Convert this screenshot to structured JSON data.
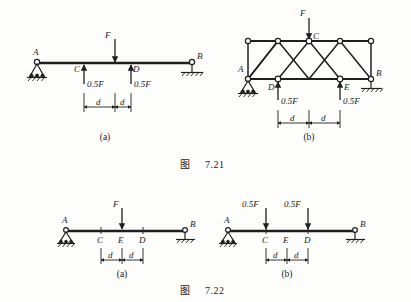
{
  "page": {
    "background": "#fdfdfb",
    "ink": "#1f1f1f"
  },
  "figures": [
    {
      "id": "fig-7-21",
      "caption_prefix": "图",
      "caption_number": "7.21",
      "panels": [
        {
          "id": "7-21-a",
          "sublabel": "(a)",
          "type": "simply-supported-beam",
          "supports": [
            {
              "node": "A",
              "kind": "pin",
              "label": "A"
            },
            {
              "node": "B",
              "kind": "roller",
              "label": "B"
            }
          ],
          "points": [
            {
              "label": "A",
              "role": "support-left"
            },
            {
              "label": "C",
              "role": "load-point"
            },
            {
              "label": "D",
              "role": "load-point"
            },
            {
              "label": "B",
              "role": "support-right"
            }
          ],
          "loads": [
            {
              "label": "F",
              "magnitude": "F",
              "direction": "down",
              "at": "midspan-CD",
              "side": "above"
            },
            {
              "label": "0.5F",
              "magnitude": "0.5F",
              "direction": "up",
              "at": "C",
              "side": "below"
            },
            {
              "label": "0.5F",
              "magnitude": "0.5F",
              "direction": "up",
              "at": "D",
              "side": "below"
            }
          ],
          "dimensions": [
            {
              "label": "d",
              "from": "C",
              "to": "midspan-CD"
            },
            {
              "label": "d",
              "from": "midspan-CD",
              "to": "D"
            }
          ]
        },
        {
          "id": "7-21-b",
          "sublabel": "(b)",
          "type": "truss",
          "supports": [
            {
              "node": "A",
              "kind": "pin",
              "label": "A"
            },
            {
              "node": "B",
              "kind": "roller",
              "label": "B"
            }
          ],
          "points": [
            {
              "label": "A",
              "role": "bottom-left-support"
            },
            {
              "label": "C",
              "role": "top-center"
            },
            {
              "label": "D",
              "role": "bottom-load"
            },
            {
              "label": "E",
              "role": "bottom-load"
            },
            {
              "label": "B",
              "role": "bottom-right-support"
            }
          ],
          "top_chord_nodes": 5,
          "bottom_chord_nodes": 4,
          "loads": [
            {
              "label": "F",
              "magnitude": "F",
              "direction": "down",
              "at": "C",
              "side": "above"
            },
            {
              "label": "0.5F",
              "magnitude": "0.5F",
              "direction": "up",
              "at": "D",
              "side": "below"
            },
            {
              "label": "0.5F",
              "magnitude": "0.5F",
              "direction": "up",
              "at": "E",
              "side": "below"
            }
          ],
          "dimensions": [
            {
              "label": "d",
              "from": "D",
              "to": "center"
            },
            {
              "label": "d",
              "from": "center",
              "to": "E"
            }
          ]
        }
      ]
    },
    {
      "id": "fig-7-22",
      "caption_prefix": "图",
      "caption_number": "7.22",
      "panels": [
        {
          "id": "7-22-a",
          "sublabel": "(a)",
          "type": "simply-supported-beam",
          "supports": [
            {
              "node": "A",
              "kind": "pin",
              "label": "A"
            },
            {
              "node": "B",
              "kind": "roller",
              "label": "B"
            }
          ],
          "points": [
            {
              "label": "A",
              "role": "support-left"
            },
            {
              "label": "C",
              "role": "marker"
            },
            {
              "label": "E",
              "role": "load-point"
            },
            {
              "label": "D",
              "role": "marker"
            },
            {
              "label": "B",
              "role": "support-right"
            }
          ],
          "loads": [
            {
              "label": "F",
              "magnitude": "F",
              "direction": "down",
              "at": "E",
              "side": "above"
            }
          ],
          "dimensions": [
            {
              "label": "d",
              "from": "C",
              "to": "E"
            },
            {
              "label": "d",
              "from": "E",
              "to": "D"
            }
          ]
        },
        {
          "id": "7-22-b",
          "sublabel": "(b)",
          "type": "simply-supported-beam",
          "supports": [
            {
              "node": "A",
              "kind": "pin",
              "label": "A"
            },
            {
              "node": "B",
              "kind": "roller",
              "label": "B"
            }
          ],
          "points": [
            {
              "label": "A",
              "role": "support-left"
            },
            {
              "label": "C",
              "role": "load-point"
            },
            {
              "label": "E",
              "role": "marker"
            },
            {
              "label": "D",
              "role": "load-point"
            },
            {
              "label": "B",
              "role": "support-right"
            }
          ],
          "loads": [
            {
              "label": "0.5F",
              "magnitude": "0.5F",
              "direction": "down",
              "at": "C",
              "side": "above"
            },
            {
              "label": "0.5F",
              "magnitude": "0.5F",
              "direction": "down",
              "at": "D",
              "side": "above"
            }
          ],
          "dimensions": [
            {
              "label": "d",
              "from": "C",
              "to": "E"
            },
            {
              "label": "d",
              "from": "E",
              "to": "D"
            }
          ]
        }
      ]
    }
  ],
  "labels": {
    "A": "A",
    "B": "B",
    "C": "C",
    "D": "D",
    "E": "E",
    "F": "F",
    "half_F": "0.5F",
    "d": "d",
    "sub_a": "(a)",
    "sub_b": "(b)",
    "fig_word": "图",
    "fig_721": "7.21",
    "fig_722": "7.22"
  }
}
